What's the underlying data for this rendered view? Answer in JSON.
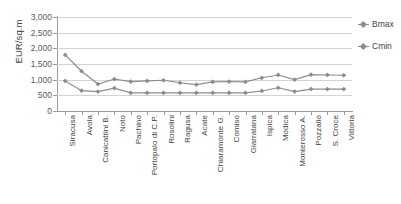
{
  "chart_data": {
    "type": "line",
    "title": "",
    "xlabel": "",
    "ylabel": "EUR/sq.m",
    "ylim": [
      0,
      3000
    ],
    "ytick_step": 500,
    "ytick_labels": [
      "3,000",
      "2,500",
      "2,000",
      "1,500",
      "1,000",
      "500",
      "0"
    ],
    "ytick_values": [
      3000,
      2500,
      2000,
      1500,
      1000,
      500,
      0
    ],
    "grid": true,
    "legend_position": "right",
    "categories": [
      "Siracusa",
      "Avola",
      "Canicattini B.",
      "Noto",
      "Pachino",
      "Portopalo di C.P.",
      "Rosolini",
      "Ragusa",
      "Acate",
      "Chiaramonte G.",
      "Comiso",
      "Giarratana",
      "Ispica",
      "Modica",
      "Monterosso A.",
      "Pozzallo",
      "S. Croce",
      "Vittoria"
    ],
    "series": [
      {
        "name": "Bmax",
        "color": "#8c8c8c",
        "values": [
          1790,
          1270,
          860,
          1020,
          940,
          960,
          980,
          900,
          840,
          930,
          940,
          930,
          1060,
          1150,
          1000,
          1160,
          1150,
          1140
        ]
      },
      {
        "name": "Cmin",
        "color": "#8c8c8c",
        "values": [
          960,
          650,
          620,
          730,
          580,
          580,
          580,
          580,
          580,
          580,
          580,
          580,
          640,
          740,
          620,
          700,
          700,
          700
        ]
      }
    ]
  },
  "legend": {
    "items": [
      {
        "label": "Bmax"
      },
      {
        "label": "Cmin"
      }
    ]
  },
  "axis": {
    "y_title": "EUR/sq.m"
  }
}
